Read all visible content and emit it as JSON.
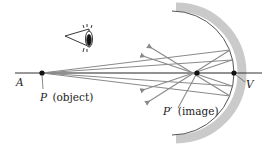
{
  "diagram": {
    "type": "concave-mirror-ray-diagram",
    "labels": {
      "axis_start": "A",
      "object_point": "P",
      "object_text": "(object)",
      "image_point": "P′",
      "image_text": "(image)",
      "vertex": "V"
    },
    "points": {
      "A": [
        18,
        73
      ],
      "P": [
        42,
        73
      ],
      "P_prime": [
        197,
        73
      ],
      "V": [
        234,
        73
      ]
    },
    "mirror": {
      "center": [
        170,
        73
      ],
      "radius": 66,
      "thickness": 8,
      "color": "#c8c8c8",
      "edge_color": "#555555"
    },
    "colors": {
      "axis": "#333333",
      "ray": "#8a8a8a",
      "point": "#111111"
    },
    "icons": [
      "eye-icon"
    ]
  }
}
